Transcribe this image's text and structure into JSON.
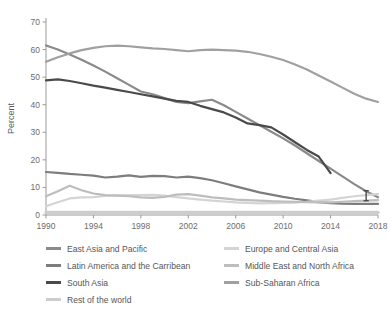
{
  "chart_data": {
    "type": "line",
    "title": "",
    "xlabel": "",
    "ylabel": "Percent",
    "xlim": [
      1990,
      2018
    ],
    "ylim": [
      0,
      70
    ],
    "grid": false,
    "legend_position": "bottom",
    "xticks": [
      "1990",
      "1994",
      "1998",
      "2002",
      "2006",
      "2010",
      "2014",
      "2018"
    ],
    "yticks": [
      "0",
      "10",
      "20",
      "30",
      "40",
      "50",
      "60",
      "70"
    ],
    "x": [
      1990,
      1991,
      1992,
      1993,
      1994,
      1995,
      1996,
      1997,
      1998,
      1999,
      2000,
      2001,
      2002,
      2003,
      2004,
      2005,
      2006,
      2007,
      2008,
      2009,
      2010,
      2011,
      2012,
      2013,
      2014,
      2015,
      2016,
      2017,
      2018
    ],
    "annotations": [
      {
        "name": "marker",
        "x": 2017,
        "y": 7,
        "symbol": "error-bar"
      }
    ],
    "series": [
      {
        "name": "East Asia and Pacific",
        "color": "#8a8a8a",
        "x": [
          1990,
          1991,
          1992,
          1993,
          1994,
          1995,
          1996,
          1997,
          1998,
          1999,
          2000,
          2001,
          2002,
          2003,
          2004,
          2005,
          2006,
          2007,
          2008,
          2009,
          2010,
          2011,
          2012,
          2013,
          2014,
          2015,
          2016,
          2017,
          2018
        ],
        "values": [
          61.5,
          60.0,
          58.2,
          56.3,
          54.2,
          52.0,
          49.6,
          47.2,
          44.8,
          43.8,
          42.4,
          41.0,
          40.6,
          41.2,
          41.8,
          39.8,
          37.4,
          35.0,
          32.6,
          30.2,
          27.8,
          25.2,
          22.4,
          19.6,
          16.8,
          14.0,
          11.2,
          8.6,
          6.4
        ]
      },
      {
        "name": "Latin America and the Carribean",
        "color": "#7d7d7d",
        "x": [
          1990,
          1991,
          1992,
          1993,
          1994,
          1995,
          1996,
          1997,
          1998,
          1999,
          2000,
          2001,
          2002,
          2003,
          2004,
          2005,
          2006,
          2007,
          2008,
          2009,
          2010,
          2011,
          2012,
          2013,
          2014,
          2015,
          2016,
          2017,
          2018
        ],
        "values": [
          15.6,
          15.3,
          14.9,
          14.6,
          14.3,
          13.6,
          13.9,
          14.4,
          13.8,
          14.2,
          14.1,
          13.6,
          13.9,
          13.4,
          12.6,
          11.5,
          10.4,
          9.3,
          8.2,
          7.4,
          6.6,
          5.9,
          5.3,
          4.7,
          4.3,
          4.1,
          4.0,
          4.0,
          4.0
        ]
      },
      {
        "name": "South Asia",
        "color": "#4a4a4a",
        "x": [
          1990,
          1991,
          1992,
          1993,
          1994,
          1995,
          1996,
          1997,
          1998,
          1999,
          2000,
          2001,
          2002,
          2003,
          2004,
          2005,
          2006,
          2007,
          2008,
          2009,
          2010,
          2011,
          2012,
          2013,
          2014
        ],
        "values": [
          48.8,
          49.2,
          48.6,
          47.8,
          46.9,
          46.2,
          45.4,
          44.6,
          43.8,
          43.0,
          42.2,
          41.4,
          41.0,
          39.6,
          38.4,
          37.2,
          35.4,
          33.2,
          32.6,
          31.8,
          29.2,
          26.4,
          23.6,
          21.2,
          15.2
        ]
      },
      {
        "name": "Rest of the world",
        "color": "#cdcdcd",
        "x": [
          1990,
          1991,
          1992,
          1993,
          1994,
          1995,
          1996,
          1997,
          1998,
          1999,
          2000,
          2001,
          2002,
          2003,
          2004,
          2005,
          2006,
          2007,
          2008,
          2009,
          2010,
          2011,
          2012,
          2013,
          2014,
          2015,
          2016,
          2017,
          2018
        ],
        "values": [
          0.9,
          0.9,
          0.9,
          0.9,
          0.9,
          0.9,
          0.9,
          0.9,
          0.9,
          0.9,
          0.9,
          0.9,
          0.9,
          0.9,
          0.9,
          0.9,
          0.9,
          0.9,
          0.9,
          0.9,
          0.9,
          0.9,
          0.9,
          0.9,
          0.9,
          0.9,
          0.9,
          0.9,
          0.9
        ]
      },
      {
        "name": "Europe and Central Asia",
        "color": "#d4d4d4",
        "x": [
          1990,
          1991,
          1992,
          1993,
          1994,
          1995,
          1996,
          1997,
          1998,
          1999,
          2000,
          2001,
          2002,
          2003,
          2004,
          2005,
          2006,
          2007,
          2008,
          2009,
          2010,
          2011,
          2012,
          2013,
          2014,
          2015,
          2016,
          2017,
          2018
        ],
        "values": [
          3.2,
          4.6,
          6.0,
          6.4,
          6.5,
          6.9,
          7.1,
          7.2,
          7.2,
          7.3,
          7.0,
          6.5,
          6.0,
          5.6,
          5.2,
          4.9,
          4.6,
          4.4,
          4.2,
          4.3,
          4.4,
          4.5,
          4.8,
          5.2,
          5.6,
          6.2,
          6.8,
          7.2,
          7.6
        ]
      },
      {
        "name": "Middle East and North Africa",
        "color": "#bdbdbd",
        "x": [
          1990,
          1991,
          1992,
          1993,
          1994,
          1995,
          1996,
          1997,
          1998,
          1999,
          2000,
          2001,
          2002,
          2003,
          2004,
          2005,
          2006,
          2007,
          2008,
          2009,
          2010,
          2011,
          2012,
          2013,
          2014,
          2015,
          2016,
          2017,
          2018
        ],
        "values": [
          6.8,
          8.6,
          10.6,
          9.0,
          7.8,
          7.2,
          7.0,
          6.8,
          6.4,
          6.2,
          6.6,
          7.4,
          7.6,
          7.0,
          6.4,
          6.0,
          5.6,
          5.4,
          5.2,
          5.0,
          4.9,
          4.8,
          4.7,
          4.6,
          4.6,
          4.8,
          5.0,
          5.2,
          5.4
        ]
      },
      {
        "name": "Sub-Saharan Africa",
        "color": "#a0a0a0",
        "x": [
          1990,
          1991,
          1992,
          1993,
          1994,
          1995,
          1996,
          1997,
          1998,
          1999,
          2000,
          2001,
          2002,
          2003,
          2004,
          2005,
          2006,
          2007,
          2008,
          2009,
          2010,
          2011,
          2012,
          2013,
          2014,
          2015,
          2016,
          2017,
          2018
        ],
        "values": [
          55.6,
          57.2,
          58.6,
          59.8,
          60.6,
          61.2,
          61.4,
          61.2,
          60.8,
          60.4,
          60.2,
          59.8,
          59.4,
          59.8,
          60.0,
          59.8,
          59.6,
          59.2,
          58.4,
          57.4,
          56.2,
          54.6,
          52.8,
          50.6,
          48.4,
          46.2,
          44.0,
          42.2,
          41.0
        ]
      }
    ]
  },
  "axis": {
    "y_title": "Percent",
    "y_ticks": [
      "70",
      "60",
      "50",
      "40",
      "30",
      "20",
      "10",
      "0"
    ],
    "x_ticks": [
      "1990",
      "1994",
      "1998",
      "2002",
      "2006",
      "2010",
      "2014",
      "2018"
    ]
  },
  "legend": {
    "left_items": [
      {
        "label": "East Asia and Pacific",
        "color": "#8a8a8a"
      },
      {
        "label": "Latin America and the Carribean",
        "color": "#7d7d7d"
      },
      {
        "label": "South Asia",
        "color": "#4a4a4a"
      },
      {
        "label": "Rest of the world",
        "color": "#cdcdcd"
      }
    ],
    "right_items": [
      {
        "label": "Europe and Central Asia",
        "color": "#d4d4d4"
      },
      {
        "label": "Middle East and North Africa",
        "color": "#bdbdbd"
      },
      {
        "label": "Sub-Saharan Africa",
        "color": "#a0a0a0"
      }
    ]
  }
}
